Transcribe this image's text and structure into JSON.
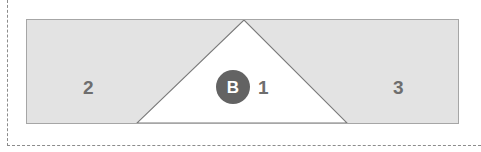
{
  "diagram": {
    "title": "",
    "colors": {
      "region_fill": "#e3e3e3",
      "region_stroke": "#a6a6a6",
      "cutout_fill": "#ffffff",
      "cutout_stroke": "#7a7a7a",
      "label_text": "#6e6e6e",
      "guide_line": "#8c8c8c",
      "badge_fill": "#636363",
      "badge_text": "#ffffff"
    },
    "guides": {
      "vertical_label": "left-dashed-guide",
      "horizontal_label": "bottom-dashed-guide"
    },
    "shapes": {
      "rectangle": {
        "name": "outer-rectangle",
        "x": 26,
        "y": 19,
        "width": 433,
        "height": 105
      },
      "triangle": {
        "name": "center-triangle-cutout",
        "apex_x": 217,
        "apex_y": 0,
        "left_x": 110,
        "left_y": 103,
        "right_x": 320,
        "right_y": 103
      }
    },
    "regions": [
      {
        "id": "region-2",
        "label": "2",
        "x": 83,
        "y": 78
      },
      {
        "id": "region-1",
        "label": "1",
        "x": 258,
        "y": 78
      },
      {
        "id": "region-3",
        "label": "3",
        "x": 393,
        "y": 78
      }
    ],
    "badge": {
      "id": "badge-b",
      "label": "B",
      "cx": 233,
      "cy": 87,
      "r": 17
    }
  }
}
